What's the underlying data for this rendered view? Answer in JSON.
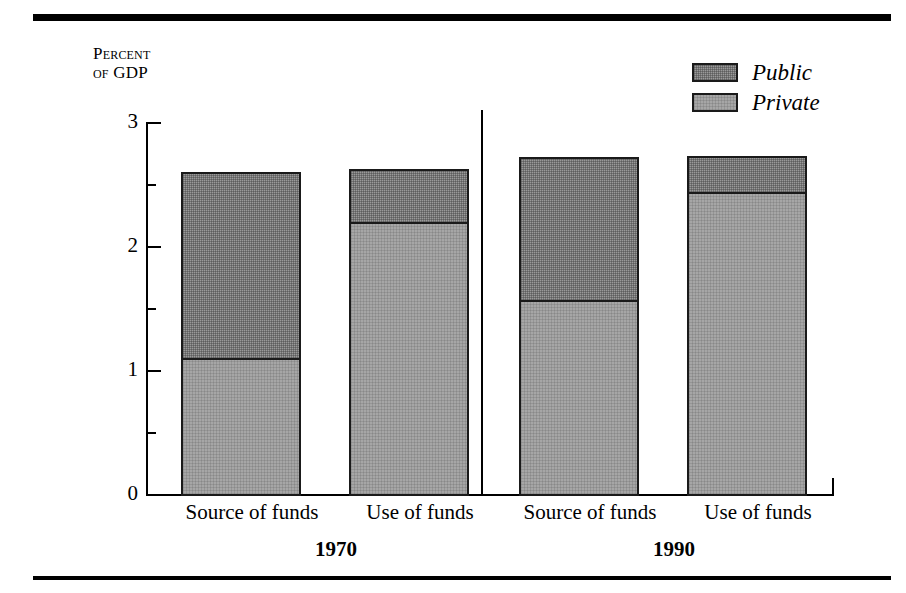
{
  "figure": {
    "rule_top": "horizontal-rule",
    "rule_bottom": "horizontal-rule"
  },
  "axis": {
    "title_line1": "Percent",
    "title_line2_prefix": "of ",
    "title_line2_value": "GDP",
    "tick_labels": [
      "3",
      "2",
      "1",
      "0"
    ]
  },
  "legend": {
    "items": [
      {
        "label": "Public",
        "color": "#9a9a9a"
      },
      {
        "label": "Private",
        "color": "#a6a6a6"
      }
    ]
  },
  "groups": [
    {
      "label": "1970",
      "categories": [
        "Source of funds",
        "Use of funds"
      ]
    },
    {
      "label": "1990",
      "categories": [
        "Source of funds",
        "Use of funds"
      ]
    }
  ],
  "chart_data": {
    "type": "bar",
    "title": "",
    "subtitle": "",
    "xlabel": "",
    "ylabel": "Percent of GDP",
    "ylim": [
      0,
      3
    ],
    "ytick_major": [
      0,
      1,
      2,
      3
    ],
    "ytick_minor": [
      0.5,
      1.5,
      2.5
    ],
    "grid": false,
    "stacked": true,
    "legend_position": "top-right",
    "group_divider": true,
    "categories": [
      "1970 Source of funds",
      "1970 Use of funds",
      "1990 Source of funds",
      "1990 Use of funds"
    ],
    "series": [
      {
        "name": "Private",
        "color": "#a6a6a6",
        "values": [
          1.11,
          2.2,
          1.57,
          2.44
        ]
      },
      {
        "name": "Public",
        "color": "#9a9a9a",
        "values": [
          1.49,
          0.42,
          1.15,
          0.29
        ]
      }
    ],
    "totals": [
      2.6,
      2.62,
      2.72,
      2.73
    ]
  }
}
